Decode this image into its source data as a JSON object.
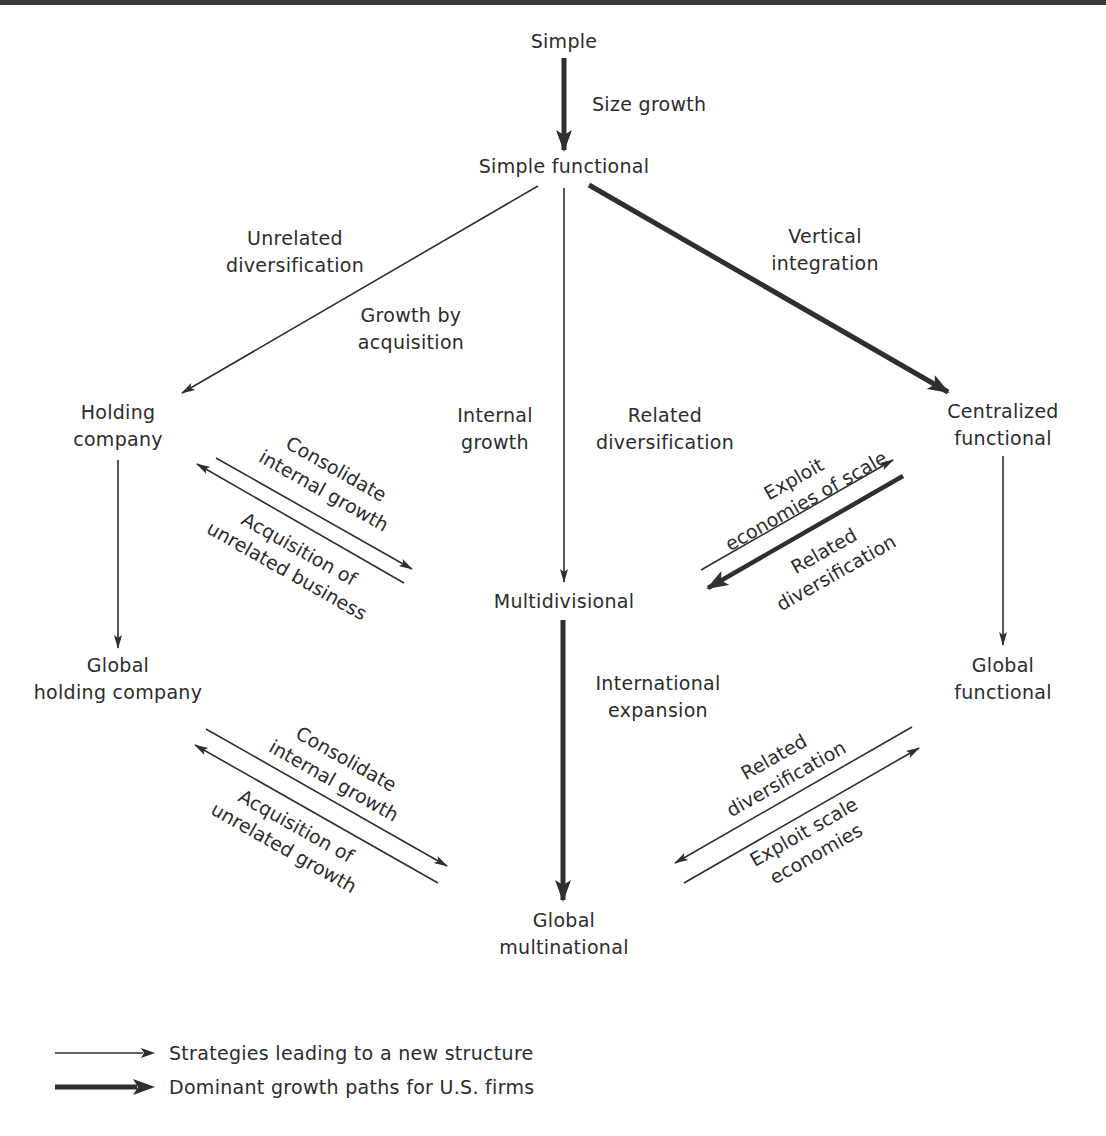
{
  "nodes": {
    "simple": "Simple",
    "simple_functional": "Simple functional",
    "holding_company": [
      "Holding",
      "company"
    ],
    "centralized_functional": [
      "Centralized",
      "functional"
    ],
    "multidivisional": "Multidivisional",
    "global_holding_company": [
      "Global",
      "holding company"
    ],
    "global_functional": [
      "Global",
      "functional"
    ],
    "global_multinational": [
      "Global",
      "multinational"
    ]
  },
  "edge_labels": {
    "size_growth": "Size growth",
    "unrelated_diversification": [
      "Unrelated",
      "diversification"
    ],
    "growth_by_acquisition": [
      "Growth by",
      "acquisition"
    ],
    "vertical_integration": [
      "Vertical",
      "integration"
    ],
    "internal_growth": [
      "Internal",
      "growth"
    ],
    "related_diversification_center": [
      "Related",
      "diversification"
    ],
    "consolidate_internal_growth_upper": [
      "Consolidate",
      "internal growth"
    ],
    "acquisition_unrelated_business": [
      "Acquisition of",
      "unrelated business"
    ],
    "exploit_economies_of_scale": [
      "Exploit",
      "economies of scale"
    ],
    "related_diversification_upper_right": [
      "Related",
      "diversification"
    ],
    "international_expansion": [
      "International",
      "expansion"
    ],
    "consolidate_internal_growth_lower": [
      "Consolidate",
      "internal growth"
    ],
    "acquisition_unrelated_growth": [
      "Acquisition of",
      "unrelated growth"
    ],
    "related_diversification_lower_right": [
      "Related",
      "diversification"
    ],
    "exploit_scale_economies": [
      "Exploit scale",
      "economies"
    ]
  },
  "legend": {
    "thin": "Strategies leading to a new structure",
    "thick": "Dominant growth paths for U.S. firms"
  },
  "colors": {
    "line": "#2f2f2f",
    "text": "#2c2c2c",
    "background": "#ffffff"
  }
}
